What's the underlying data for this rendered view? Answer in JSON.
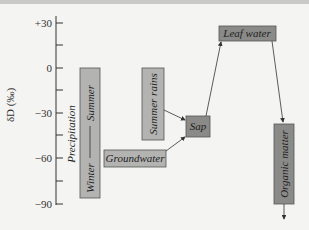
{
  "axis": {
    "label": "δD (‰)",
    "ticks": [
      {
        "label": "+30",
        "value": 30
      },
      {
        "label": "0",
        "value": 0
      },
      {
        "label": "−30",
        "value": -30
      },
      {
        "label": "−60",
        "value": -60
      },
      {
        "label": "−90",
        "value": -90
      }
    ]
  },
  "nodes": {
    "precipitation": {
      "label": "Precipitation",
      "winter": "Winter",
      "summer": "Summer"
    },
    "summer_rains": {
      "label": "Summer rains"
    },
    "groundwater": {
      "label": "Groundwater"
    },
    "sap": {
      "label": "Sap"
    },
    "leaf_water": {
      "label": "Leaf water"
    },
    "organic_matter": {
      "label": "Organic matter"
    }
  },
  "colors": {
    "light_box": "#b3b3b1",
    "dark_box": "#8a8a88",
    "line": "#333333"
  }
}
